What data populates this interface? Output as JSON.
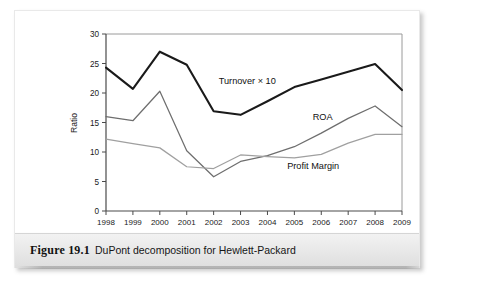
{
  "figure": {
    "caption_number": "Figure 19.1",
    "caption_text": "DuPont decomposition for Hewlett-Packard"
  },
  "chart_data": {
    "type": "line",
    "title": "",
    "xlabel": "",
    "ylabel": "Ratio",
    "categories": [
      "1998",
      "1999",
      "2000",
      "2001",
      "2002",
      "2003",
      "2004",
      "2005",
      "2006",
      "2007",
      "2008",
      "2009"
    ],
    "xlim": [
      1998,
      2009
    ],
    "ylim": [
      0,
      30
    ],
    "yticks": [
      0,
      5,
      10,
      15,
      20,
      25,
      30
    ],
    "ytick_labels": [
      "0",
      "5",
      "10",
      "15",
      "20",
      "25",
      "30"
    ],
    "grid": false,
    "legend": "inline-annotations",
    "series": [
      {
        "name": "Turnover × 10",
        "color": "#1a1a1a",
        "width": 2.1,
        "values": [
          24.3,
          20.7,
          27.0,
          24.8,
          16.9,
          16.3,
          18.6,
          21.0,
          22.3,
          23.6,
          24.9,
          20.5
        ],
        "label_x": 2003.25,
        "label_y": 21.6
      },
      {
        "name": "ROA",
        "color": "#6e6e6e",
        "width": 1.25,
        "values": [
          16.0,
          15.3,
          20.3,
          10.2,
          5.8,
          8.4,
          9.4,
          10.9,
          13.2,
          15.7,
          17.8,
          14.3
        ],
        "label_x": 2006.05,
        "label_y": 15.5
      },
      {
        "name": "Profit Margin",
        "color": "#a0a0a0",
        "width": 1.25,
        "values": [
          12.2,
          11.4,
          10.7,
          7.5,
          7.2,
          9.5,
          9.2,
          9.0,
          9.6,
          11.5,
          13.0,
          13.0
        ],
        "label_x": 2005.7,
        "label_y": 7.2
      }
    ]
  },
  "colors": {
    "turnover": "#1a1a1a",
    "roa": "#6e6e6e",
    "profit_margin": "#a0a0a0",
    "axis": "#555555",
    "caption_bar": "#e7e7e7"
  }
}
